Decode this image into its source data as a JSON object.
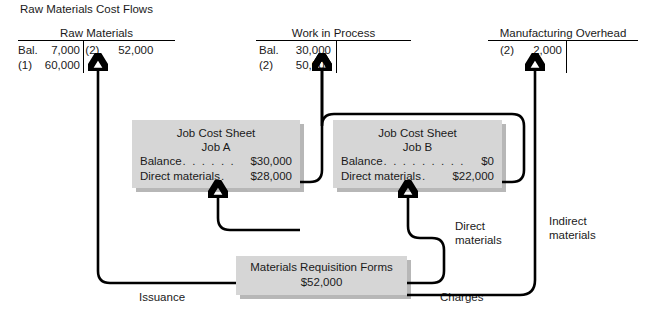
{
  "figure": {
    "title": "Raw Materials Cost Flows"
  },
  "t_accounts": [
    {
      "id": "raw-materials",
      "title": "Raw Materials",
      "debits": [
        {
          "ref": "Bal.",
          "amount": "7,000"
        },
        {
          "ref": "(1)",
          "amount": "60,000"
        }
      ],
      "credits": [
        {
          "ref": "(2)",
          "amount": "52,000"
        }
      ]
    },
    {
      "id": "work-in-process",
      "title": "Work in Process",
      "debits": [
        {
          "ref": "Bal.",
          "amount": "30,000"
        },
        {
          "ref": "(2)",
          "amount": "50,000"
        }
      ],
      "credits": []
    },
    {
      "id": "manufacturing-overhead",
      "title": "Manufacturing Overhead",
      "debits": [
        {
          "ref": "(2)",
          "amount": "2,000"
        }
      ],
      "credits": []
    }
  ],
  "job_cost_sheets": [
    {
      "id": "job-a",
      "heading": "Job Cost Sheet",
      "job": "Job A",
      "rows": [
        {
          "label": "Balance",
          "leader": ". . . . . . . .",
          "amount": "$30,000"
        },
        {
          "label": "Direct materials",
          "leader": ".",
          "amount": "$28,000"
        }
      ]
    },
    {
      "id": "job-b",
      "heading": "Job Cost Sheet",
      "job": "Job B",
      "rows": [
        {
          "label": "Balance",
          "leader": ". . . . . . . . . . . .",
          "amount": "$0"
        },
        {
          "label": "Direct materials",
          "leader": ".",
          "amount": "$22,000"
        }
      ]
    }
  ],
  "source_document": {
    "id": "materials-requisition-forms",
    "title": "Materials Requisition Forms",
    "amount": "$52,000"
  },
  "connector_labels": {
    "issuance": "Issuance",
    "charges": "Charges",
    "direct_materials_line1": "Direct",
    "direct_materials_line2": "materials",
    "indirect_materials_line1": "Indirect",
    "indirect_materials_line2": "materials"
  },
  "colors": {
    "box_fill": "#d6d6d6",
    "box_shadow": "#aaaaaa",
    "line": "#000000",
    "background": "#ffffff",
    "text": "#1a1a1a"
  }
}
